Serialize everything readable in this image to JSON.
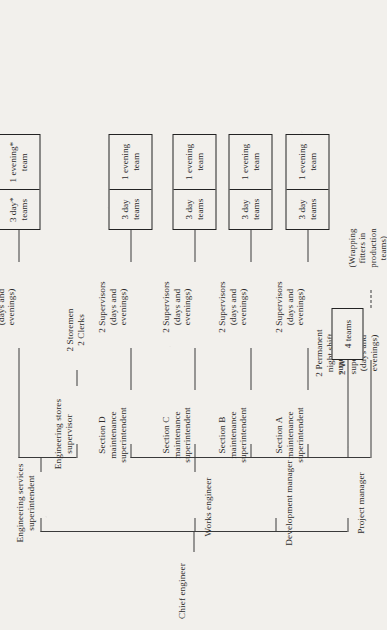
{
  "chart_title": "Chief engineer",
  "root": {
    "label": "Chief engineer"
  },
  "level1": [
    {
      "label": "Project manager"
    },
    {
      "label": "Development manager"
    },
    {
      "label": "Works engineer"
    },
    {
      "label": "Engineering services\nsuperintendent"
    }
  ],
  "works_engineer_children": [
    {
      "label": "2 Wrapping\nsupervisors\n(days and\nevenings)"
    },
    {
      "label": "2 Permanent\nnight shift\nsupervisors"
    },
    {
      "label": "Section A\nmaintenance\nsuperintendent"
    },
    {
      "label": "Section B\nmaintenance\nsuperintendent"
    },
    {
      "label": "Section C\nmaintenance\nsuperintendent"
    },
    {
      "label": "Section D\nmaintenance\nsuperintendent"
    }
  ],
  "engineering_services_children": [
    {
      "label": "Engineering stores\nsupervisor"
    },
    {
      "label": "2 Supervisors\n(days and\nevenings)"
    }
  ],
  "stores_staff": {
    "label": "2 Storemen\n2 Clerks"
  },
  "supervisor_nodes": [
    {
      "label": "2 Supervisors\n(days and\nevenings)"
    },
    {
      "label": "2 Supervisors\n(days and\nevenings)"
    },
    {
      "label": "2 Supervisors\n(days and\nevenings)"
    },
    {
      "label": "2 Supervisors\n(days and\nevenings)"
    }
  ],
  "wrapping_note": {
    "label": "(Wrapping\nfitters in\nproduction\nteams)"
  },
  "team_boxes": [
    {
      "name": "night-shift-teams",
      "cells": [
        "4 teams"
      ]
    },
    {
      "name": "section-a-teams",
      "cells": [
        "3 day\nteams",
        "1 evening\nteam"
      ]
    },
    {
      "name": "section-b-teams",
      "cells": [
        "3 day\nteams",
        "1 evening\nteam"
      ]
    },
    {
      "name": "section-c-teams",
      "cells": [
        "3 day\nteams",
        "1 evening\nteam"
      ]
    },
    {
      "name": "section-d-teams",
      "cells": [
        "3 day\nteams",
        "1 evening\nteam"
      ]
    },
    {
      "name": "engineering-services-teams",
      "cells": [
        "3 day*\nteams",
        "1 evening*\nteam"
      ]
    }
  ],
  "colors": {
    "paper": "#f2f0ec",
    "ink": "#2e2c2b",
    "rule": "#3a3a3a",
    "box_border": "#232323"
  }
}
